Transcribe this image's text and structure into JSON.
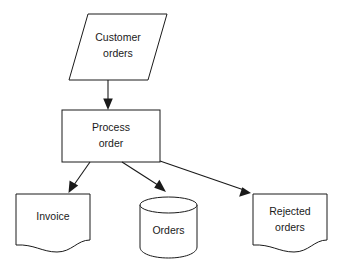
{
  "diagram": {
    "background_color": "#ffffff",
    "line_color": "#1a1a1a",
    "text_color": "#1a1a1a",
    "nodes": [
      {
        "id": "customer-orders",
        "shape": "parallelogram",
        "role": "input",
        "label_line1": "Customer",
        "label_line2": "orders"
      },
      {
        "id": "process-order",
        "shape": "rectangle",
        "role": "process",
        "label_line1": "Process",
        "label_line2": "order"
      },
      {
        "id": "invoice",
        "shape": "document",
        "role": "output-document",
        "label_line1": "Invoice",
        "label_line2": ""
      },
      {
        "id": "orders-store",
        "shape": "cylinder",
        "role": "data-store",
        "label_line1": "Orders",
        "label_line2": ""
      },
      {
        "id": "rejected-orders",
        "shape": "document",
        "role": "output-document",
        "label_line1": "Rejected",
        "label_line2": "orders"
      }
    ],
    "edges": [
      {
        "id": "edge-customer-to-process",
        "from": "customer-orders",
        "to": "process-order",
        "label": ""
      },
      {
        "id": "edge-process-to-invoice",
        "from": "process-order",
        "to": "invoice",
        "label": ""
      },
      {
        "id": "edge-process-to-orders",
        "from": "process-order",
        "to": "orders-store",
        "label": ""
      },
      {
        "id": "edge-process-to-rejected",
        "from": "process-order",
        "to": "rejected-orders",
        "label": ""
      }
    ]
  }
}
